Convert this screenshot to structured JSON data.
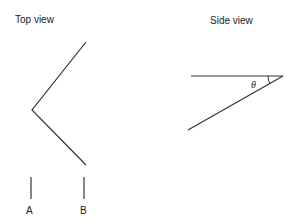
{
  "top_view": {
    "title": "Top view",
    "markers": [
      {
        "label": "A"
      },
      {
        "label": "B"
      }
    ]
  },
  "side_view": {
    "title": "Side view",
    "angle_label": "θ"
  },
  "colors": {
    "line": "#333333",
    "text": "#222222"
  }
}
